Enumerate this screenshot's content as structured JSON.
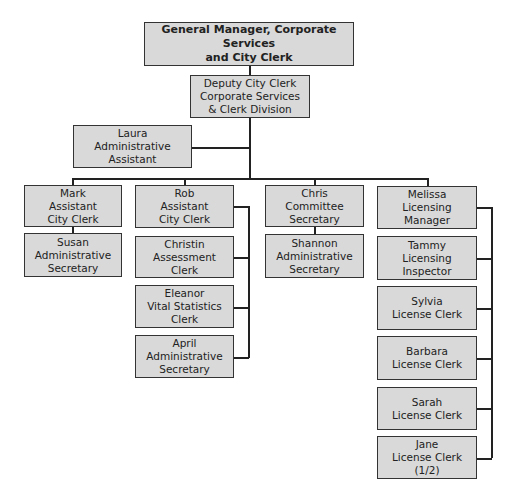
{
  "chart": {
    "top": {
      "title": "General Manager, Corporate Services\nand City Clerk"
    },
    "deputy": {
      "title": "Deputy City Clerk\nCorporate Services\n& Clerk Division"
    },
    "assistant": {
      "name": "Laura",
      "role": "Laura\nAdministrative\nAssistant"
    },
    "columns": [
      {
        "head": {
          "name": "Mark",
          "role": "Mark\nAssistant\nCity Clerk"
        },
        "reports": [
          {
            "name": "Susan",
            "role": "Susan\nAdministrative\nSecretary"
          }
        ]
      },
      {
        "head": {
          "name": "Rob",
          "role": "Rob\nAssistant\nCity Clerk"
        },
        "reports": [
          {
            "name": "Christin",
            "role": "Christin\nAssessment\nClerk"
          },
          {
            "name": "Eleanor",
            "role": "Eleanor\nVital Statistics\nClerk"
          },
          {
            "name": "April",
            "role": "April\nAdministrative\nSecretary"
          }
        ]
      },
      {
        "head": {
          "name": "Chris",
          "role": "Chris\nCommittee\nSecretary"
        },
        "reports": [
          {
            "name": "Shannon",
            "role": "Shannon\nAdministrative\nSecretary"
          }
        ]
      },
      {
        "head": {
          "name": "Melissa",
          "role": "Melissa\nLicensing\nManager"
        },
        "reports": [
          {
            "name": "Tammy",
            "role": "Tammy\nLicensing\nInspector"
          },
          {
            "name": "Sylvia",
            "role": "Sylvia\nLicense Clerk"
          },
          {
            "name": "Barbara",
            "role": "Barbara\nLicense Clerk"
          },
          {
            "name": "Sarah",
            "role": "Sarah\nLicense Clerk"
          },
          {
            "name": "Jane",
            "role": "Jane\nLicense Clerk\n(1/2)"
          }
        ]
      }
    ]
  },
  "colors": {
    "box_fill": "#d9d9d9",
    "border": "#333333",
    "line": "#222222"
  }
}
